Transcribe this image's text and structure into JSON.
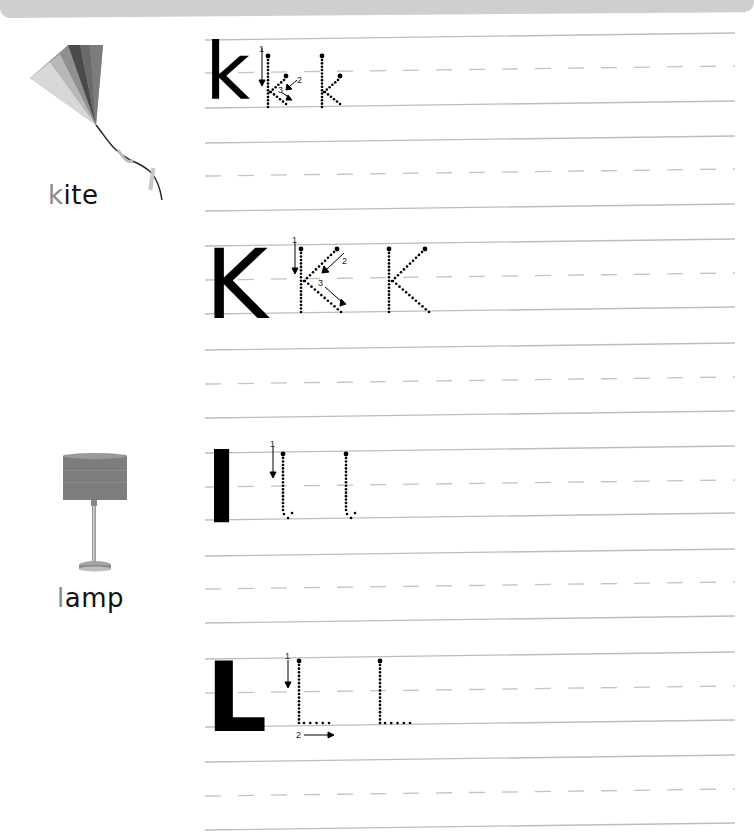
{
  "worksheet": {
    "sections": [
      {
        "picture": "kite-image",
        "word": "kite",
        "word_first_letter": "k",
        "word_rest": "ite",
        "rows": [
          {
            "model_letter": "k",
            "case": "lowercase",
            "stroke_numbers": [
              "1",
              "2",
              "3"
            ]
          },
          {
            "model_letter": "K",
            "case": "uppercase",
            "stroke_numbers": [
              "1",
              "2",
              "3"
            ]
          }
        ]
      },
      {
        "picture": "lamp-image",
        "word": "lamp",
        "word_first_letter": "l",
        "word_rest": "amp",
        "rows": [
          {
            "model_letter": "l",
            "case": "lowercase",
            "stroke_numbers": [
              "1"
            ]
          },
          {
            "model_letter": "L",
            "case": "uppercase",
            "stroke_numbers": [
              "1",
              "2"
            ]
          }
        ]
      }
    ],
    "colors": {
      "header_band": "#cfcfcf",
      "rule_line": "#bdbdbd",
      "dash_line": "#c4c4c4",
      "ink": "#000000",
      "hint_letter": "#8a8a8a"
    }
  }
}
